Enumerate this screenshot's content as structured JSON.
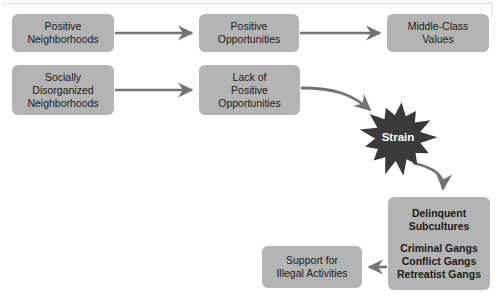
{
  "diagram": {
    "colors": {
      "node_fill": "#b4b4b4",
      "node_text": "#1a1a1a",
      "arrow": "#737373",
      "burst_fill": "#3a3a3a",
      "burst_text": "#ffffff",
      "background": "#ffffff"
    },
    "nodes": [
      {
        "id": "positive-neighborhoods",
        "lines": [
          "Positive",
          "Neighborhoods"
        ],
        "x": 12,
        "y": 14,
        "w": 102,
        "h": 38
      },
      {
        "id": "positive-opportunities",
        "lines": [
          "Positive",
          "Opportunities"
        ],
        "x": 199,
        "y": 14,
        "w": 100,
        "h": 38
      },
      {
        "id": "middle-class-values",
        "lines": [
          "Middle-Class",
          "Values"
        ],
        "x": 387,
        "y": 14,
        "w": 102,
        "h": 38
      },
      {
        "id": "socially-disorganized-neighborhoods",
        "lines": [
          "Socially",
          "Disorganized",
          "Neighborhoods"
        ],
        "x": 12,
        "y": 65,
        "w": 102,
        "h": 50
      },
      {
        "id": "lack-of-positive-opportunities",
        "lines": [
          "Lack of",
          "Positive",
          "Opportunities"
        ],
        "x": 199,
        "y": 65,
        "w": 101,
        "h": 50
      },
      {
        "id": "support-for-illegal-activities",
        "lines": [
          "Support for",
          "Illegal Activities"
        ],
        "x": 262,
        "y": 246,
        "w": 100,
        "h": 42
      }
    ],
    "delinquent_node": {
      "id": "delinquent-subcultures",
      "heading": [
        "Delinquent",
        "Subcultures"
      ],
      "items": [
        "Criminal Gangs",
        "Conflict Gangs",
        "Retreatist Gangs"
      ],
      "x": 388,
      "y": 197,
      "w": 102,
      "h": 93
    },
    "burst": {
      "id": "strain",
      "label": "Strain",
      "cx": 398,
      "cy": 138,
      "r_outer": 36,
      "r_inner": 23,
      "points": 13
    },
    "edges": [
      {
        "id": "edge-pn-to-po",
        "from": "positive-neighborhoods",
        "to": "positive-opportunities",
        "kind": "straight-right"
      },
      {
        "id": "edge-po-to-mcv",
        "from": "positive-opportunities",
        "to": "middle-class-values",
        "kind": "straight-right"
      },
      {
        "id": "edge-sdn-to-lpo",
        "from": "socially-disorganized-neighborhoods",
        "to": "lack-of-positive-opportunities",
        "kind": "straight-right"
      },
      {
        "id": "edge-lpo-to-strain",
        "from": "lack-of-positive-opportunities",
        "to": "strain",
        "kind": "curve-down-right"
      },
      {
        "id": "edge-strain-to-ds",
        "from": "strain",
        "to": "delinquent-subcultures",
        "kind": "curve-down"
      },
      {
        "id": "edge-ds-to-support",
        "from": "delinquent-subcultures",
        "to": "support-for-illegal-activities",
        "kind": "straight-left"
      }
    ]
  }
}
